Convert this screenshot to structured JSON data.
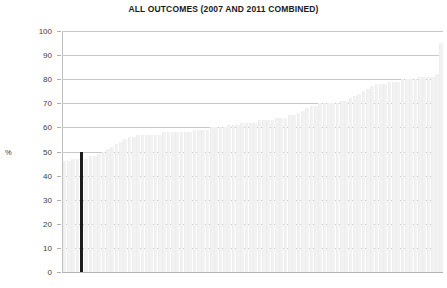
{
  "chart_data": {
    "type": "bar",
    "title": "ALL OUTCOMES (2007 AND 2011 COMBINED)",
    "xlabel": "",
    "ylabel": "%",
    "ylim": [
      0,
      100
    ],
    "yticks": [
      0,
      10,
      20,
      30,
      40,
      50,
      60,
      70,
      80,
      90,
      100
    ],
    "ytick_labels": [
      "0",
      "10",
      "20",
      "30",
      "40",
      "50",
      "60",
      "70",
      "80",
      "90",
      "100"
    ],
    "grid": true,
    "legend": "none",
    "xtick_labels": [],
    "bar_color": "#f2f2f2",
    "highlight_color": "#1c1c1c",
    "highlight_index": 4,
    "highlight_value": 50,
    "categories": [
      "1",
      "2",
      "3",
      "4",
      "5",
      "6",
      "7",
      "8",
      "9",
      "10",
      "11",
      "12",
      "13",
      "14",
      "15",
      "16",
      "17",
      "18",
      "19",
      "20",
      "21",
      "22",
      "23",
      "24",
      "25",
      "26",
      "27",
      "28",
      "29",
      "30",
      "31",
      "32",
      "33",
      "34",
      "35",
      "36",
      "37",
      "38",
      "39",
      "40",
      "41",
      "42",
      "43",
      "44",
      "45",
      "46",
      "47",
      "48",
      "49",
      "50",
      "51",
      "52",
      "53",
      "54",
      "55",
      "56",
      "57",
      "58",
      "59",
      "60",
      "61",
      "62",
      "63",
      "64",
      "65",
      "66",
      "67",
      "68",
      "69",
      "70",
      "71",
      "72",
      "73",
      "74",
      "75",
      "76",
      "77",
      "78",
      "79",
      "80",
      "81",
      "82",
      "83",
      "84",
      "85",
      "86",
      "87",
      "88"
    ],
    "values": [
      46,
      46,
      47,
      47,
      50,
      47,
      48,
      48,
      49,
      50,
      51,
      52,
      53,
      54,
      55,
      56,
      56,
      57,
      57,
      57,
      57,
      57,
      57,
      58,
      58,
      58,
      58,
      58,
      58,
      58,
      59,
      59,
      59,
      59,
      60,
      60,
      60,
      60,
      61,
      61,
      61,
      62,
      62,
      62,
      62,
      63,
      63,
      63,
      63,
      64,
      64,
      64,
      65,
      65,
      66,
      67,
      68,
      69,
      69,
      70,
      70,
      70,
      70,
      70,
      71,
      71,
      72,
      73,
      74,
      75,
      76,
      77,
      78,
      78,
      78,
      79,
      79,
      79,
      80,
      80,
      80,
      80,
      81,
      81,
      81,
      81,
      82,
      95
    ]
  }
}
